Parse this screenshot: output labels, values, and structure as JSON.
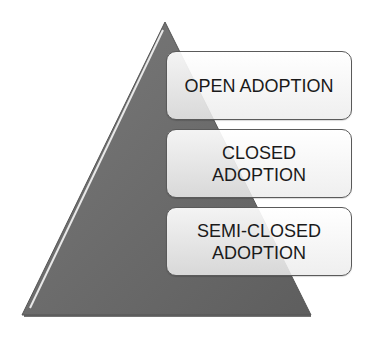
{
  "diagram": {
    "type": "pyramid-list",
    "triangle_color": "#6b6b6b",
    "items": [
      {
        "label": "OPEN ADOPTION"
      },
      {
        "label": "CLOSED ADOPTION",
        "lines": [
          "CLOSED",
          "ADOPTION"
        ]
      },
      {
        "label": "SEMI-CLOSED ADOPTION",
        "lines": [
          "SEMI-CLOSED",
          "ADOPTION"
        ]
      }
    ]
  }
}
